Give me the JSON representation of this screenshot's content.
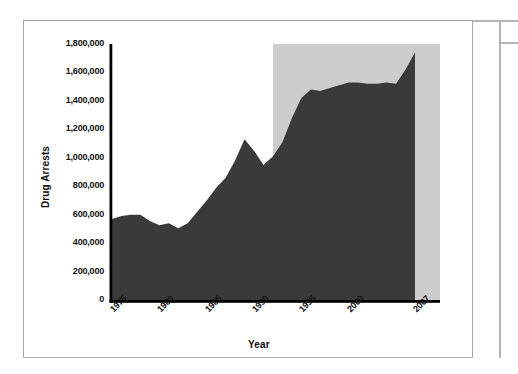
{
  "chart_data": {
    "type": "area",
    "title": "",
    "xlabel": "Year",
    "ylabel": "Drug Arrests",
    "xlim": [
      1975,
      2007
    ],
    "ylim": [
      0,
      1800000
    ],
    "grid": false,
    "legend": null,
    "series_color": "#3a3a3a",
    "shaded_region_color": "#cdcdcd",
    "shaded_region": {
      "x_start": 1992,
      "x_end": 2007,
      "y_start": 0,
      "y_end": 1800000
    },
    "x_tick_labels": [
      "1975",
      "1980",
      "1985",
      "1990",
      "1995",
      "2000",
      "2007"
    ],
    "x_tick_values": [
      1975,
      1980,
      1985,
      1990,
      1995,
      2000,
      2007
    ],
    "y_tick_labels": [
      "0",
      "200,000",
      "400,000",
      "600,000",
      "800,000",
      "1,000,000",
      "1,200,000",
      "1,400,000",
      "1,600,000",
      "1,800,000"
    ],
    "y_tick_values": [
      0,
      200000,
      400000,
      600000,
      800000,
      1000000,
      1200000,
      1400000,
      1600000,
      1800000
    ],
    "x": [
      1975,
      1976,
      1977,
      1978,
      1979,
      1980,
      1981,
      1982,
      1983,
      1984,
      1985,
      1986,
      1987,
      1988,
      1989,
      1990,
      1991,
      1992,
      1993,
      1994,
      1995,
      1996,
      1997,
      1998,
      1999,
      2000,
      2001,
      2002,
      2003,
      2004,
      2005,
      2006,
      2007
    ],
    "values": [
      570000,
      590000,
      600000,
      600000,
      555000,
      525000,
      540000,
      505000,
      540000,
      620000,
      700000,
      790000,
      860000,
      980000,
      1130000,
      1050000,
      950000,
      1010000,
      1110000,
      1280000,
      1420000,
      1480000,
      1470000,
      1490000,
      1510000,
      1530000,
      1530000,
      1520000,
      1520000,
      1530000,
      1520000,
      1620000,
      1740000
    ]
  },
  "axis": {
    "y_title": "Drug Arrests",
    "x_title": "Year"
  }
}
